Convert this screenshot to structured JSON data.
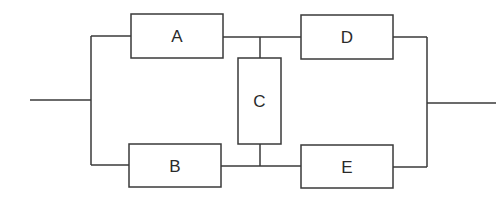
{
  "diagram": {
    "type": "reliability-block-diagram",
    "colors": {
      "line": "#3a3a3a",
      "background": "#ffffff",
      "text": "#2a2a2a"
    },
    "blocks": [
      {
        "id": "A",
        "label": "A",
        "x": 131,
        "y": 14,
        "w": 92,
        "h": 44
      },
      {
        "id": "B",
        "label": "B",
        "x": 129,
        "y": 144,
        "w": 92,
        "h": 43
      },
      {
        "id": "C",
        "label": "C",
        "x": 238,
        "y": 58,
        "w": 43,
        "h": 86
      },
      {
        "id": "D",
        "label": "D",
        "x": 301,
        "y": 15,
        "w": 92,
        "h": 44
      },
      {
        "id": "E",
        "label": "E",
        "x": 301,
        "y": 145,
        "w": 92,
        "h": 43
      }
    ],
    "connections": [
      {
        "from": "input",
        "to": "A"
      },
      {
        "from": "input",
        "to": "B"
      },
      {
        "from": "A",
        "to": "D"
      },
      {
        "from": "B",
        "to": "E"
      },
      {
        "from": "A-D junction",
        "to": "C"
      },
      {
        "from": "C",
        "to": "B-E junction"
      },
      {
        "from": "D",
        "to": "output"
      },
      {
        "from": "E",
        "to": "output"
      }
    ]
  }
}
